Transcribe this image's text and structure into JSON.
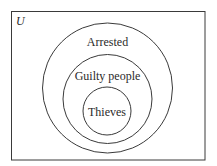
{
  "diagram": {
    "type": "venn-nested",
    "universe_label": "U",
    "sets": [
      {
        "name": "Arrested",
        "label": "Arrested",
        "cx": 107.5,
        "cy": 88,
        "r": 65,
        "label_y": 46
      },
      {
        "name": "Guilty people",
        "label": "Guilty people",
        "cx": 107.5,
        "cy": 99,
        "r": 44.5,
        "label_y": 80
      },
      {
        "name": "Thieves",
        "label": "Thieves",
        "cx": 107,
        "cy": 111,
        "r": 24,
        "label_y": 116
      }
    ],
    "colors": {
      "stroke": "#3a3a3a",
      "text": "#2a2a2a",
      "background": "#ffffff"
    }
  }
}
